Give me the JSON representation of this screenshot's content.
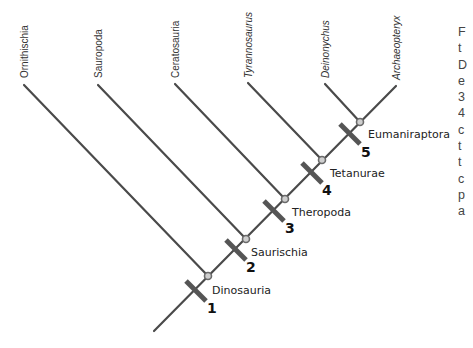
{
  "taxa": [
    {
      "name": "Ornithischia",
      "italic": false
    },
    {
      "name": "Sauropoda",
      "italic": false
    },
    {
      "name": "Ceratosauria",
      "italic": false
    },
    {
      "name": "Tyrannosaurus",
      "italic": true
    },
    {
      "name": "Deinonychus",
      "italic": true
    },
    {
      "name": "Archaeopteryx",
      "italic": true
    }
  ],
  "clades": [
    {
      "name": "Dinosauria",
      "marker": "1"
    },
    {
      "name": "Saurischia",
      "marker": "2"
    },
    {
      "name": "Theropoda",
      "marker": "3"
    },
    {
      "name": "Tetanurae",
      "marker": "4"
    },
    {
      "name": "Eumaniraptora",
      "marker": "5"
    }
  ],
  "caption_fragment_lines": [
    "F",
    "t",
    "D",
    "e",
    "3",
    "4",
    "c",
    "t",
    "t",
    "c",
    "p",
    "a"
  ],
  "colors": {
    "branch": "#4a4a4a",
    "tick": "#555555",
    "node_fill": "#cfcfcf",
    "node_stroke": "#6a6a6a",
    "text": "#222222"
  }
}
